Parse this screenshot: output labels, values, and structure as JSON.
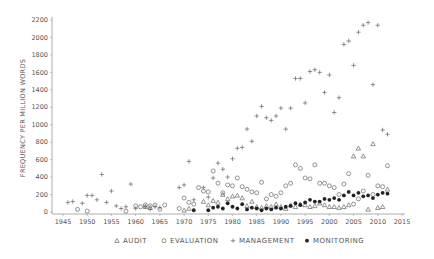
{
  "chart_data": {
    "type": "scatter",
    "title": "",
    "xlabel": "",
    "ylabel": "FREQUENCY PER MILLION WORDS",
    "xlim": [
      1943,
      2015
    ],
    "ylim": [
      0,
      2200
    ],
    "xticks": [
      1945,
      1950,
      1955,
      1960,
      1965,
      1970,
      1975,
      1980,
      1985,
      1990,
      1995,
      2000,
      2005,
      2010,
      2015
    ],
    "yticks": [
      0,
      200,
      400,
      600,
      800,
      1000,
      1200,
      1400,
      1600,
      1800,
      2000,
      2200
    ],
    "grid": false,
    "legend_position": "bottom",
    "series": [
      {
        "name": "AUDIT",
        "marker": "triangle",
        "points": [
          [
            1962,
            60
          ],
          [
            1963,
            50
          ],
          [
            1970,
            20
          ],
          [
            1971,
            40
          ],
          [
            1974,
            120
          ],
          [
            1975,
            80
          ],
          [
            1976,
            130
          ],
          [
            1977,
            110
          ],
          [
            1978,
            200
          ],
          [
            1979,
            150
          ],
          [
            1980,
            180
          ],
          [
            1981,
            190
          ],
          [
            1982,
            160
          ],
          [
            1983,
            70
          ],
          [
            1984,
            120
          ],
          [
            1985,
            60
          ],
          [
            1986,
            50
          ],
          [
            1987,
            70
          ],
          [
            1988,
            60
          ],
          [
            1989,
            90
          ],
          [
            1990,
            60
          ],
          [
            1991,
            40
          ],
          [
            1992,
            80
          ],
          [
            1993,
            60
          ],
          [
            1994,
            90
          ],
          [
            1995,
            80
          ],
          [
            1996,
            60
          ],
          [
            1997,
            70
          ],
          [
            1998,
            100
          ],
          [
            1999,
            80
          ],
          [
            2000,
            60
          ],
          [
            2001,
            60
          ],
          [
            2002,
            50
          ],
          [
            2003,
            60
          ],
          [
            2004,
            80
          ],
          [
            2005,
            640
          ],
          [
            2006,
            730
          ],
          [
            2007,
            640
          ],
          [
            2008,
            30
          ],
          [
            2009,
            780
          ],
          [
            2010,
            50
          ],
          [
            2011,
            60
          ],
          [
            2012,
            260
          ]
        ]
      },
      {
        "name": "EVALUATION",
        "marker": "circle",
        "points": [
          [
            1948,
            30
          ],
          [
            1950,
            10
          ],
          [
            1958,
            10
          ],
          [
            1960,
            70
          ],
          [
            1961,
            60
          ],
          [
            1962,
            80
          ],
          [
            1963,
            70
          ],
          [
            1964,
            80
          ],
          [
            1965,
            30
          ],
          [
            1966,
            80
          ],
          [
            1969,
            40
          ],
          [
            1970,
            160
          ],
          [
            1971,
            110
          ],
          [
            1972,
            90
          ],
          [
            1973,
            280
          ],
          [
            1974,
            240
          ],
          [
            1975,
            230
          ],
          [
            1976,
            470
          ],
          [
            1977,
            330
          ],
          [
            1978,
            220
          ],
          [
            1979,
            310
          ],
          [
            1980,
            300
          ],
          [
            1981,
            390
          ],
          [
            1982,
            290
          ],
          [
            1983,
            260
          ],
          [
            1984,
            230
          ],
          [
            1985,
            220
          ],
          [
            1986,
            340
          ],
          [
            1987,
            150
          ],
          [
            1988,
            200
          ],
          [
            1989,
            180
          ],
          [
            1990,
            220
          ],
          [
            1991,
            300
          ],
          [
            1992,
            330
          ],
          [
            1993,
            540
          ],
          [
            1994,
            500
          ],
          [
            1995,
            390
          ],
          [
            1996,
            380
          ],
          [
            1997,
            540
          ],
          [
            1998,
            330
          ],
          [
            1999,
            330
          ],
          [
            2000,
            300
          ],
          [
            2001,
            280
          ],
          [
            2002,
            200
          ],
          [
            2003,
            320
          ],
          [
            2004,
            440
          ],
          [
            2005,
            90
          ],
          [
            2006,
            150
          ],
          [
            2007,
            240
          ],
          [
            2008,
            420
          ],
          [
            2009,
            200
          ],
          [
            2010,
            300
          ],
          [
            2011,
            290
          ],
          [
            2012,
            530
          ]
        ]
      },
      {
        "name": "MANAGEMENT",
        "marker": "plus",
        "points": [
          [
            1946,
            110
          ],
          [
            1947,
            120
          ],
          [
            1949,
            100
          ],
          [
            1950,
            190
          ],
          [
            1951,
            190
          ],
          [
            1952,
            140
          ],
          [
            1953,
            430
          ],
          [
            1954,
            110
          ],
          [
            1955,
            240
          ],
          [
            1956,
            70
          ],
          [
            1957,
            40
          ],
          [
            1958,
            60
          ],
          [
            1959,
            320
          ],
          [
            1960,
            40
          ],
          [
            1962,
            60
          ],
          [
            1963,
            30
          ],
          [
            1964,
            60
          ],
          [
            1965,
            50
          ],
          [
            1969,
            280
          ],
          [
            1970,
            310
          ],
          [
            1971,
            580
          ],
          [
            1972,
            140
          ],
          [
            1974,
            280
          ],
          [
            1975,
            170
          ],
          [
            1976,
            390
          ],
          [
            1977,
            560
          ],
          [
            1978,
            490
          ],
          [
            1979,
            400
          ],
          [
            1980,
            610
          ],
          [
            1981,
            730
          ],
          [
            1982,
            740
          ],
          [
            1983,
            950
          ],
          [
            1984,
            810
          ],
          [
            1985,
            1100
          ],
          [
            1986,
            1210
          ],
          [
            1987,
            1080
          ],
          [
            1988,
            1050
          ],
          [
            1989,
            1100
          ],
          [
            1990,
            1190
          ],
          [
            1991,
            950
          ],
          [
            1992,
            1190
          ],
          [
            1993,
            1530
          ],
          [
            1994,
            1530
          ],
          [
            1995,
            1250
          ],
          [
            1996,
            1610
          ],
          [
            1997,
            1630
          ],
          [
            1998,
            1600
          ],
          [
            1999,
            1370
          ],
          [
            2000,
            1570
          ],
          [
            2001,
            1140
          ],
          [
            2002,
            1310
          ],
          [
            2003,
            1920
          ],
          [
            2004,
            1960
          ],
          [
            2005,
            1680
          ],
          [
            2006,
            2060
          ],
          [
            2007,
            2140
          ],
          [
            2008,
            2170
          ],
          [
            2009,
            1460
          ],
          [
            2010,
            2140
          ],
          [
            2011,
            940
          ],
          [
            2012,
            890
          ]
        ]
      },
      {
        "name": "MONITORING",
        "marker": "filled-circle",
        "points": [
          [
            1972,
            20
          ],
          [
            1975,
            20
          ],
          [
            1976,
            50
          ],
          [
            1977,
            60
          ],
          [
            1978,
            40
          ],
          [
            1979,
            100
          ],
          [
            1980,
            60
          ],
          [
            1981,
            40
          ],
          [
            1982,
            90
          ],
          [
            1983,
            30
          ],
          [
            1984,
            50
          ],
          [
            1985,
            40
          ],
          [
            1986,
            20
          ],
          [
            1987,
            40
          ],
          [
            1988,
            30
          ],
          [
            1989,
            50
          ],
          [
            1990,
            40
          ],
          [
            1991,
            60
          ],
          [
            1992,
            70
          ],
          [
            1993,
            100
          ],
          [
            1994,
            80
          ],
          [
            1995,
            110
          ],
          [
            1996,
            140
          ],
          [
            1997,
            120
          ],
          [
            1998,
            120
          ],
          [
            1999,
            150
          ],
          [
            2000,
            140
          ],
          [
            2001,
            160
          ],
          [
            2002,
            140
          ],
          [
            2003,
            190
          ],
          [
            2004,
            230
          ],
          [
            2005,
            190
          ],
          [
            2006,
            220
          ],
          [
            2007,
            180
          ],
          [
            2008,
            190
          ],
          [
            2009,
            160
          ],
          [
            2010,
            200
          ],
          [
            2011,
            220
          ],
          [
            2012,
            210
          ]
        ]
      }
    ]
  }
}
